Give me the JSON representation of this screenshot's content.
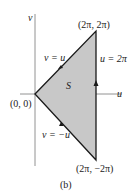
{
  "diagram": {
    "caption": "(b)",
    "axes": {
      "horizontal": "u",
      "vertical": "v"
    },
    "region_label": "S",
    "vertices": {
      "origin": "(0, 0)",
      "top": "(2π, 2π)",
      "bottom": "(2π, −2π)"
    },
    "edges": {
      "upper": "v = u",
      "right": "u = 2π",
      "lower": "v = −u"
    },
    "colors": {
      "fill": "#c8c8c8",
      "line": "#1a1a1a",
      "axis": "#777777"
    }
  }
}
